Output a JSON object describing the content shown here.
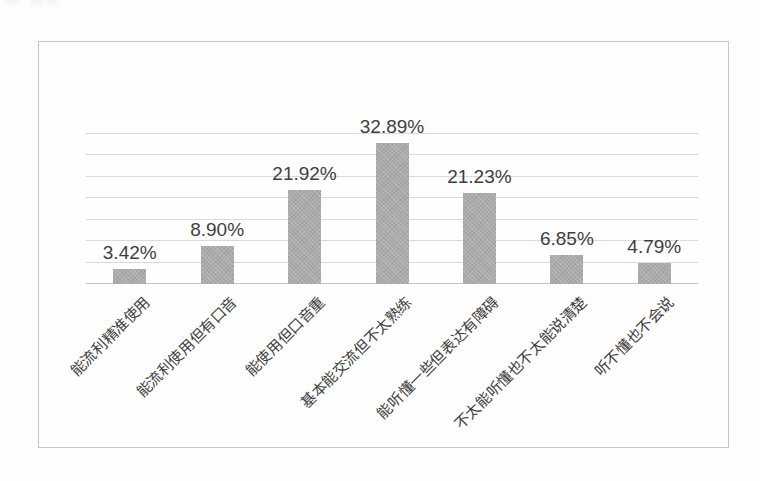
{
  "chart_data": {
    "type": "bar",
    "title": "",
    "xlabel": "",
    "ylabel": "",
    "categories": [
      "能流利精准使用",
      "能流利使用但有口音",
      "能使用但口音重",
      "基本能交流但不太熟练",
      "能听懂一些但表达有障碍",
      "不太能听懂也不太能说清楚",
      "听不懂也不会说"
    ],
    "values": [
      3.42,
      8.9,
      21.92,
      32.89,
      21.23,
      6.85,
      4.79
    ],
    "value_labels": [
      "3.42%",
      "8.90%",
      "21.92%",
      "32.89%",
      "21.23%",
      "6.85%",
      "4.79%"
    ],
    "ylim": [
      0,
      35
    ],
    "grid_step": 5,
    "grid": true,
    "legend_position": "none",
    "colors": {
      "bar_fill": "#aaaaaa",
      "gridline": "#dadada",
      "axis_line": "#c4c4c4",
      "text": "#3e3e3e",
      "frame_border": "#c6c7c7",
      "background": "#fefefe"
    }
  }
}
